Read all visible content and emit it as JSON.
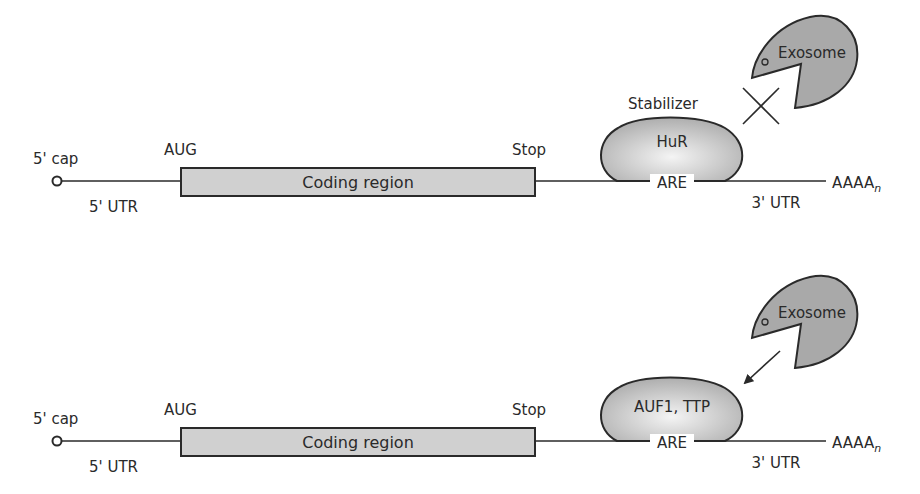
{
  "colors": {
    "ink": "#2a2a2a",
    "box_fill": "#d0d0d0",
    "exosome_fill": "#a9a9a9",
    "protein_light": "#f2f2f2",
    "protein_dark": "#b3b3b3"
  },
  "panels": [
    {
      "id": "stabilized",
      "cap_label": "5' cap",
      "utr5_label": "5' UTR",
      "start_label": "AUG",
      "coding_label": "Coding region",
      "stop_label": "Stop",
      "protein_role_label": "Stabilizer",
      "protein_label": "HuR",
      "element_label": "ARE",
      "utr3_label": "3' UTR",
      "polyA_label": "AAAA",
      "polyA_subscript": "n",
      "exosome_label": "Exosome",
      "exosome_action": "blocked (X)"
    },
    {
      "id": "destabilized",
      "cap_label": "5' cap",
      "utr5_label": "5' UTR",
      "start_label": "AUG",
      "coding_label": "Coding region",
      "stop_label": "Stop",
      "protein_label": "AUF1, TTP",
      "element_label": "ARE",
      "utr3_label": "3' UTR",
      "polyA_label": "AAAA",
      "polyA_subscript": "n",
      "exosome_label": "Exosome",
      "exosome_action": "recruited (arrow)"
    }
  ]
}
